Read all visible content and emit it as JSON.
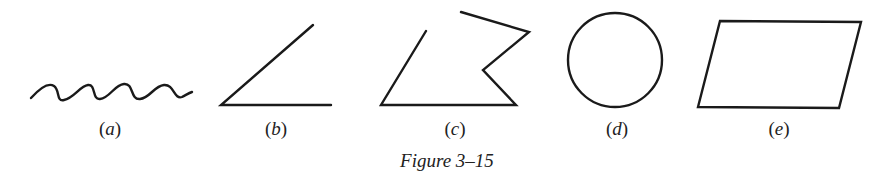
{
  "figure": {
    "caption": "Figure 3–15",
    "stroke_color": "#1a1a1a",
    "panels": [
      {
        "id": "a",
        "label": "(a)",
        "label_letter": "a",
        "shape": "wavy curve"
      },
      {
        "id": "b",
        "label": "(b)",
        "label_letter": "b",
        "shape": "angle"
      },
      {
        "id": "c",
        "label": "(c)",
        "label_letter": "c",
        "shape": "open polygonal path"
      },
      {
        "id": "d",
        "label": "(d)",
        "label_letter": "d",
        "shape": "circle"
      },
      {
        "id": "e",
        "label": "(e)",
        "label_letter": "e",
        "shape": "parallelogram"
      }
    ]
  }
}
